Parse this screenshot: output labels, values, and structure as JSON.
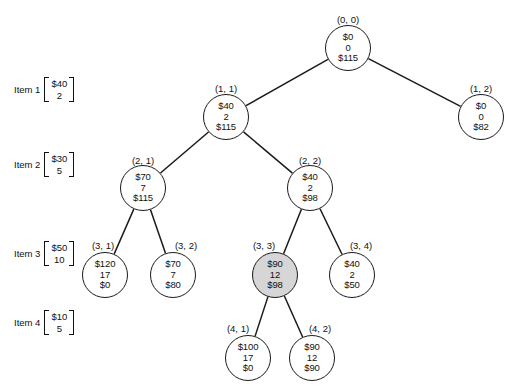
{
  "diagram": {
    "stroke_color": "#1a1a1a",
    "shaded_fill": "#d6d6d6",
    "node_fill": "#ffffff"
  },
  "items": [
    {
      "name": "Item 1",
      "value": "$40",
      "weight": "2",
      "x": 14,
      "y": 77
    },
    {
      "name": "Item 2",
      "value": "$30",
      "weight": "5",
      "x": 14,
      "y": 152
    },
    {
      "name": "Item 3",
      "value": "$50",
      "weight": "10",
      "x": 14,
      "y": 241
    },
    {
      "name": "Item 4",
      "value": "$10",
      "weight": "5",
      "x": 14,
      "y": 310
    }
  ],
  "nodes": [
    {
      "id": "n00",
      "label": "(0, 0)",
      "value": "$0",
      "weight": "0",
      "bound": "$115",
      "cx": 348,
      "cy": 48,
      "r": 23,
      "shaded": false,
      "label_x": 348,
      "label_y": 14
    },
    {
      "id": "n11",
      "label": "(1, 1)",
      "value": "$40",
      "weight": "2",
      "bound": "$115",
      "cx": 226,
      "cy": 117,
      "r": 23,
      "shaded": false,
      "label_x": 226,
      "label_y": 83
    },
    {
      "id": "n12",
      "label": "(1, 2)",
      "value": "$0",
      "weight": "0",
      "bound": "$82",
      "cx": 481,
      "cy": 117,
      "r": 23,
      "shaded": false,
      "label_x": 481,
      "label_y": 83
    },
    {
      "id": "n21",
      "label": "(2, 1)",
      "value": "$70",
      "weight": "7",
      "bound": "$115",
      "cx": 143,
      "cy": 188,
      "r": 23,
      "shaded": false,
      "label_x": 143,
      "label_y": 155
    },
    {
      "id": "n22",
      "label": "(2, 2)",
      "value": "$40",
      "weight": "2",
      "bound": "$98",
      "cx": 310,
      "cy": 188,
      "r": 23,
      "shaded": false,
      "label_x": 310,
      "label_y": 155
    },
    {
      "id": "n31",
      "label": "(3, 1)",
      "value": "$120",
      "weight": "17",
      "bound": "$0",
      "cx": 105,
      "cy": 275,
      "r": 23,
      "shaded": false,
      "label_x": 103,
      "label_y": 240
    },
    {
      "id": "n32",
      "label": "(3, 2)",
      "value": "$70",
      "weight": "7",
      "bound": "$80",
      "cx": 173,
      "cy": 275,
      "r": 23,
      "shaded": false,
      "label_x": 186,
      "label_y": 240
    },
    {
      "id": "n33",
      "label": "(3, 3)",
      "value": "$90",
      "weight": "12",
      "bound": "$98",
      "cx": 275,
      "cy": 275,
      "r": 23,
      "shaded": true,
      "label_x": 264,
      "label_y": 240
    },
    {
      "id": "n34",
      "label": "(3, 4)",
      "value": "$40",
      "weight": "2",
      "bound": "$50",
      "cx": 352,
      "cy": 275,
      "r": 23,
      "shaded": false,
      "label_x": 361,
      "label_y": 240
    },
    {
      "id": "n41",
      "label": "(4, 1)",
      "value": "$100",
      "weight": "17",
      "bound": "$0",
      "cx": 248,
      "cy": 358,
      "r": 23,
      "shaded": false,
      "label_x": 238,
      "label_y": 323
    },
    {
      "id": "n42",
      "label": "(4, 2)",
      "value": "$90",
      "weight": "12",
      "bound": "$90",
      "cx": 312,
      "cy": 358,
      "r": 23,
      "shaded": false,
      "label_x": 320,
      "label_y": 323
    }
  ],
  "edges": [
    {
      "from": "n00",
      "to": "n11"
    },
    {
      "from": "n00",
      "to": "n12"
    },
    {
      "from": "n11",
      "to": "n21"
    },
    {
      "from": "n11",
      "to": "n22"
    },
    {
      "from": "n21",
      "to": "n31"
    },
    {
      "from": "n21",
      "to": "n32"
    },
    {
      "from": "n22",
      "to": "n33"
    },
    {
      "from": "n22",
      "to": "n34"
    },
    {
      "from": "n33",
      "to": "n41"
    },
    {
      "from": "n33",
      "to": "n42"
    }
  ]
}
